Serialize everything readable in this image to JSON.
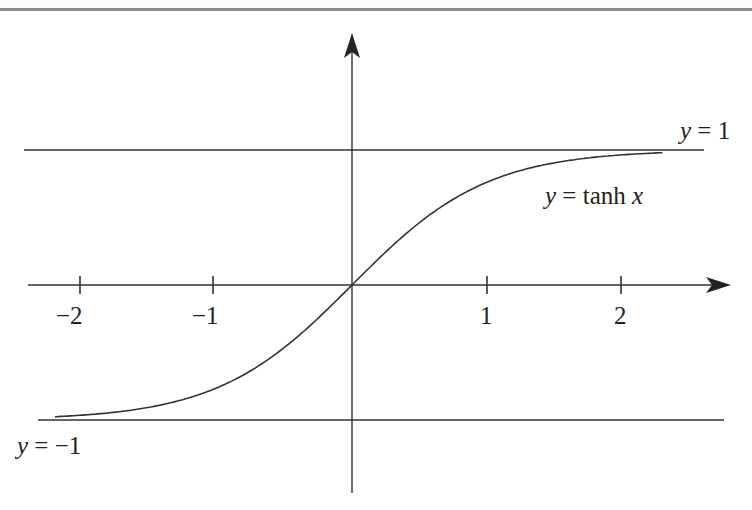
{
  "chart_data": {
    "type": "line",
    "title": "",
    "function": "tanh",
    "xlabel": "",
    "ylabel": "",
    "x_ticks": [
      -2,
      -1,
      1,
      2
    ],
    "x_tick_labels": [
      "−2",
      "−1",
      "1",
      "2"
    ],
    "xlim": [
      -2.4,
      2.8
    ],
    "ylim": [
      -1.5,
      1.9
    ],
    "grid": false,
    "legend": null,
    "series": [
      {
        "name": "y = tanh x",
        "x": [
          -2.2,
          -2.0,
          -1.5,
          -1.0,
          -0.5,
          0.0,
          0.5,
          1.0,
          1.5,
          2.0,
          2.3
        ],
        "values": [
          -0.976,
          -0.964,
          -0.905,
          -0.762,
          -0.462,
          0.0,
          0.462,
          0.762,
          0.905,
          0.964,
          0.98
        ]
      }
    ],
    "asymptotes": [
      {
        "label": "y = 1",
        "y": 1
      },
      {
        "label": "y = −1",
        "y": -1
      }
    ],
    "annotations": [
      {
        "text": "y = tanh x",
        "near_x": 1.8,
        "near_y": 0.72
      },
      {
        "text": "y = 1",
        "near_x": 2.7,
        "near_y": 1.1
      },
      {
        "text": "y = −1",
        "near_x": -2.4,
        "near_y": -1.15
      }
    ]
  },
  "labels": {
    "curve": {
      "var": "y",
      "eq": " = tanh ",
      "arg": "x"
    },
    "upper": {
      "var": "y",
      "eq": " = 1"
    },
    "lower": {
      "var": "y",
      "eq": " = −1"
    },
    "ticks": [
      "−2",
      "−1",
      "1",
      "2"
    ]
  },
  "colors": {
    "ink": "#222222",
    "rule": "#8a8a8a"
  }
}
